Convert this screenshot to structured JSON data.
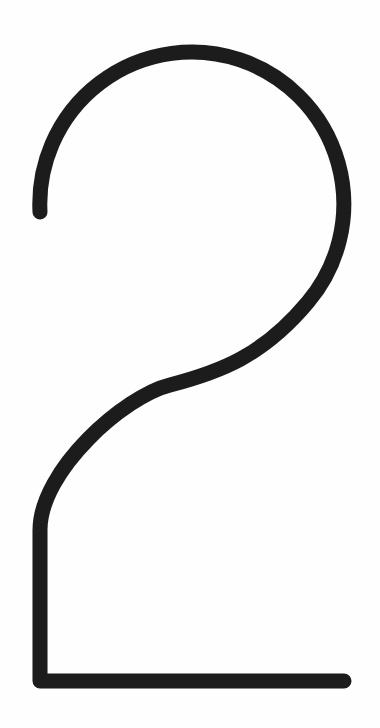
{
  "figure": {
    "glyph": "2",
    "stroke_color": "#1c1c1c",
    "background_color": "#fefefe",
    "stroke_width_px": 15
  }
}
